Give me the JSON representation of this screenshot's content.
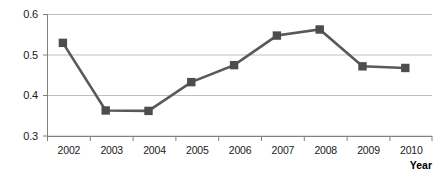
{
  "chart_data": {
    "type": "line",
    "title": "",
    "xlabel": "Year",
    "ylabel": "",
    "categories": [
      "2002",
      "2003",
      "2004",
      "2005",
      "2006",
      "2007",
      "2008",
      "2009",
      "2010"
    ],
    "values": [
      0.53,
      0.363,
      0.362,
      0.433,
      0.475,
      0.548,
      0.563,
      0.472,
      0.468
    ],
    "series": [
      {
        "name": "",
        "values": [
          0.53,
          0.363,
          0.362,
          0.433,
          0.475,
          0.548,
          0.563,
          0.472,
          0.468
        ]
      }
    ],
    "ylim": [
      0.3,
      0.6
    ],
    "ytick_labels": [
      "0.6",
      "0.5",
      "0.4",
      "0.3"
    ],
    "ytick_values": [
      0.6,
      0.5,
      0.4,
      0.3
    ],
    "grid": true,
    "legend": "none",
    "marker": "square",
    "line_color": "#595959",
    "marker_color": "#4d4d4d",
    "grid_color": "#bfbfbf",
    "axis_color": "#808080",
    "text_color": "#1a1a1a"
  }
}
